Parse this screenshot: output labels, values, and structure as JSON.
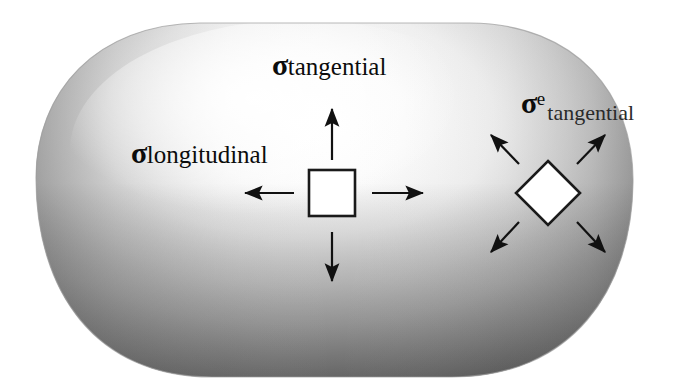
{
  "figure": {
    "kind": "stress-element-diagram",
    "background_color": "#ffffff",
    "body": {
      "name": "pressure-vessel-capsule",
      "fill_light": "#fdfdfd",
      "fill_mid": "#c9c9c9",
      "fill_dark": "#6e6e6e",
      "outline_color": "#8a8a8a",
      "bounds": {
        "x": 36,
        "y": 22,
        "width": 598,
        "height": 356
      }
    },
    "labels": {
      "tangential": {
        "symbol": "σ",
        "subscript": "tangential",
        "superscript": "",
        "full_text": "σtangential",
        "x": 272,
        "y": 50
      },
      "longitudinal": {
        "symbol": "σ",
        "subscript": "longitudinal",
        "superscript": "",
        "full_text": "σlongitudinal",
        "x": 131,
        "y": 138
      },
      "e_tangential": {
        "symbol": "σ",
        "superscript": "e",
        "subscript": "tangential",
        "full_text": "σe tangential",
        "x": 521,
        "y": 88
      }
    },
    "elements": [
      {
        "name": "square-stress-element",
        "shape": "square",
        "center_x": 332,
        "center_y": 193,
        "size": 46,
        "stroke": "#1a1a1a",
        "stroke_width": 2.5,
        "fill": "#ffffff",
        "arrows": [
          {
            "name": "arrow-up",
            "direction": "up",
            "from_x": 332,
            "from_y": 160,
            "to_x": 332,
            "to_y": 108
          },
          {
            "name": "arrow-down",
            "direction": "down",
            "from_x": 332,
            "from_y": 232,
            "to_x": 332,
            "to_y": 282
          },
          {
            "name": "arrow-left",
            "direction": "left",
            "from_x": 295,
            "from_y": 193,
            "to_x": 243,
            "to_y": 193
          },
          {
            "name": "arrow-right",
            "direction": "right",
            "from_x": 372,
            "from_y": 193,
            "to_x": 425,
            "to_y": 193
          }
        ]
      },
      {
        "name": "diamond-stress-element",
        "shape": "diamond",
        "center_x": 548,
        "center_y": 193,
        "half_diagonal": 32,
        "stroke": "#1a1a1a",
        "stroke_width": 2.5,
        "fill": "#ffffff",
        "arrows": [
          {
            "name": "arrow-up-left",
            "direction": "up-left",
            "from_x": 519,
            "from_y": 165,
            "to_x": 489,
            "to_y": 133
          },
          {
            "name": "arrow-up-right",
            "direction": "up-right",
            "from_x": 578,
            "from_y": 165,
            "to_x": 608,
            "to_y": 133
          },
          {
            "name": "arrow-down-left",
            "direction": "down-left",
            "from_x": 519,
            "from_y": 222,
            "to_x": 489,
            "to_y": 255
          },
          {
            "name": "arrow-down-right",
            "direction": "down-right",
            "from_x": 578,
            "from_y": 222,
            "to_x": 608,
            "to_y": 255
          }
        ]
      }
    ],
    "arrow_style": {
      "color": "#111111",
      "shaft_width": 2.2,
      "head_length": 22,
      "head_width": 11
    }
  }
}
